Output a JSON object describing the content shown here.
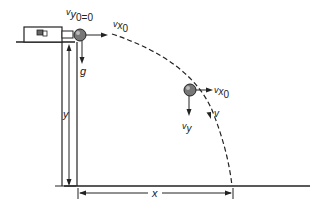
{
  "diagram": {
    "labels": {
      "initial_vy": "v",
      "initial_vy_sub": "y",
      "initial_vy_sub2": "0=0",
      "vx0_top": "v",
      "vx0_top_sub": "x",
      "vx0_top_sub2": "0",
      "gravity": "g",
      "vx0_mid": "v",
      "vx0_mid_sub": "x",
      "vx0_mid_sub2": "0",
      "vy": "v",
      "vy_sub": "y",
      "velocity": "v",
      "height": "y",
      "range": "x"
    },
    "colors": {
      "ink": "#222222",
      "ball": "#666666",
      "background": "#ffffff"
    }
  }
}
